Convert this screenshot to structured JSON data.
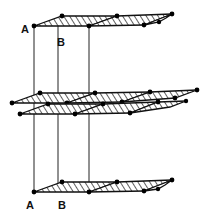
{
  "figure": {
    "background_color": "#ffffff",
    "line_color": "#111111",
    "node_color": "#000000",
    "hatch_color": "#333333",
    "fill_color": "#ffffff"
  },
  "labels": [
    {
      "id": "label-a-top",
      "text": "A",
      "x": 25,
      "y": 33
    },
    {
      "id": "label-b-top",
      "text": "B",
      "x": 61,
      "y": 46
    },
    {
      "id": "label-a-bottom",
      "text": "A",
      "x": 30,
      "y": 209
    },
    {
      "id": "label-b-bottom",
      "text": "B",
      "x": 62,
      "y": 209
    }
  ],
  "layers": [
    {
      "name": "top-layer",
      "role": "A-layer",
      "y_offset": 0,
      "hatched": true
    },
    {
      "name": "middle-layer-upper",
      "role": "B-layer",
      "y_offset": 88,
      "hatched": true
    },
    {
      "name": "middle-layer-lower",
      "role": "A-layer",
      "y_offset": 100,
      "hatched": true
    },
    {
      "name": "bottom-layer",
      "role": "A-layer",
      "y_offset": 173,
      "hatched": true
    }
  ],
  "stacking_axes": [
    {
      "name": "axis-a-left",
      "x_top": 34,
      "x_bottom": 34,
      "y_top": 26,
      "y_bottom": 192
    },
    {
      "name": "axis-b-middle",
      "x_top": 58,
      "x_bottom": 58,
      "y_top": 22,
      "y_bottom": 189
    },
    {
      "name": "axis-c-right",
      "x_top": 89,
      "x_bottom": 89,
      "y_top": 20,
      "y_bottom": 186
    }
  ],
  "geometry_notes": {
    "projection": "oblique",
    "hatch_angle_deg": 45,
    "node_radius_px": 2.2,
    "layer_outline_width_px": 1.3,
    "axis_line_width_px": 1.0
  }
}
